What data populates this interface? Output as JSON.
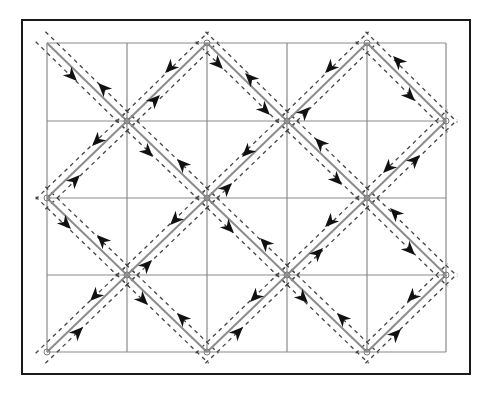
{
  "canvas": {
    "width": 487,
    "height": 401,
    "background": "#ffffff"
  },
  "frame": {
    "x": 22,
    "y": 20,
    "width": 448,
    "height": 354,
    "stroke": "#1a1a1a",
    "stroke_width": 2
  },
  "grid": {
    "cols_x": [
      47,
      127,
      207,
      287,
      367,
      446
    ],
    "rows_y": [
      43,
      121,
      198,
      275,
      352
    ],
    "stroke": "#8a8a8a",
    "stroke_width": 1.2
  },
  "colors": {
    "edge": "#8c8c8c",
    "dashed": "#444444",
    "arrow": "#111111"
  },
  "dashed_offset": 7,
  "edges": [
    {
      "from": [
        47,
        43
      ],
      "to": [
        127,
        121
      ]
    },
    {
      "from": [
        127,
        121
      ],
      "to": [
        207,
        43
      ]
    },
    {
      "from": [
        207,
        43
      ],
      "to": [
        287,
        121
      ]
    },
    {
      "from": [
        287,
        121
      ],
      "to": [
        367,
        43
      ]
    },
    {
      "from": [
        367,
        43
      ],
      "to": [
        446,
        121
      ]
    },
    {
      "from": [
        47,
        198
      ],
      "to": [
        127,
        121
      ]
    },
    {
      "from": [
        127,
        121
      ],
      "to": [
        207,
        198
      ]
    },
    {
      "from": [
        207,
        198
      ],
      "to": [
        287,
        121
      ]
    },
    {
      "from": [
        287,
        121
      ],
      "to": [
        367,
        198
      ]
    },
    {
      "from": [
        367,
        198
      ],
      "to": [
        446,
        121
      ]
    },
    {
      "from": [
        47,
        198
      ],
      "to": [
        127,
        275
      ]
    },
    {
      "from": [
        127,
        275
      ],
      "to": [
        207,
        198
      ]
    },
    {
      "from": [
        207,
        198
      ],
      "to": [
        287,
        275
      ]
    },
    {
      "from": [
        287,
        275
      ],
      "to": [
        367,
        198
      ]
    },
    {
      "from": [
        367,
        198
      ],
      "to": [
        446,
        275
      ]
    },
    {
      "from": [
        47,
        352
      ],
      "to": [
        127,
        275
      ]
    },
    {
      "from": [
        127,
        275
      ],
      "to": [
        207,
        352
      ]
    },
    {
      "from": [
        207,
        352
      ],
      "to": [
        287,
        275
      ]
    },
    {
      "from": [
        287,
        275
      ],
      "to": [
        367,
        352
      ]
    },
    {
      "from": [
        367,
        352
      ],
      "to": [
        446,
        275
      ]
    }
  ],
  "arrows": [
    {
      "x": 72,
      "y": 76,
      "dir": "down-right"
    },
    {
      "x": 103,
      "y": 88,
      "dir": "up-left"
    },
    {
      "x": 170,
      "y": 68,
      "dir": "down-left"
    },
    {
      "x": 155,
      "y": 100,
      "dir": "up-right"
    },
    {
      "x": 218,
      "y": 64,
      "dir": "down-right"
    },
    {
      "x": 250,
      "y": 78,
      "dir": "up-left"
    },
    {
      "x": 265,
      "y": 110,
      "dir": "down-right"
    },
    {
      "x": 330,
      "y": 68,
      "dir": "down-left"
    },
    {
      "x": 305,
      "y": 112,
      "dir": "up-right"
    },
    {
      "x": 398,
      "y": 61,
      "dir": "up-left"
    },
    {
      "x": 410,
      "y": 96,
      "dir": "down-right"
    },
    {
      "x": 97,
      "y": 141,
      "dir": "down-left"
    },
    {
      "x": 75,
      "y": 180,
      "dir": "up-right"
    },
    {
      "x": 148,
      "y": 152,
      "dir": "down-right"
    },
    {
      "x": 182,
      "y": 164,
      "dir": "up-left"
    },
    {
      "x": 247,
      "y": 152,
      "dir": "down-left"
    },
    {
      "x": 227,
      "y": 188,
      "dir": "up-right"
    },
    {
      "x": 320,
      "y": 143,
      "dir": "up-left"
    },
    {
      "x": 337,
      "y": 180,
      "dir": "down-right"
    },
    {
      "x": 388,
      "y": 168,
      "dir": "down-left"
    },
    {
      "x": 415,
      "y": 160,
      "dir": "up-right"
    },
    {
      "x": 66,
      "y": 224,
      "dir": "down-right"
    },
    {
      "x": 102,
      "y": 240,
      "dir": "up-left"
    },
    {
      "x": 175,
      "y": 220,
      "dir": "down-left"
    },
    {
      "x": 147,
      "y": 265,
      "dir": "up-right"
    },
    {
      "x": 229,
      "y": 228,
      "dir": "down-right"
    },
    {
      "x": 265,
      "y": 243,
      "dir": "up-left"
    },
    {
      "x": 330,
      "y": 222,
      "dir": "down-left"
    },
    {
      "x": 318,
      "y": 253,
      "dir": "up-right"
    },
    {
      "x": 395,
      "y": 213,
      "dir": "up-left"
    },
    {
      "x": 410,
      "y": 250,
      "dir": "down-right"
    },
    {
      "x": 95,
      "y": 296,
      "dir": "down-left"
    },
    {
      "x": 78,
      "y": 332,
      "dir": "up-right"
    },
    {
      "x": 143,
      "y": 300,
      "dir": "down-right"
    },
    {
      "x": 182,
      "y": 318,
      "dir": "up-left"
    },
    {
      "x": 255,
      "y": 297,
      "dir": "down-left"
    },
    {
      "x": 238,
      "y": 332,
      "dir": "up-right"
    },
    {
      "x": 303,
      "y": 298,
      "dir": "down-right"
    },
    {
      "x": 342,
      "y": 318,
      "dir": "up-left"
    },
    {
      "x": 412,
      "y": 297,
      "dir": "down-left"
    },
    {
      "x": 396,
      "y": 334,
      "dir": "up-right"
    }
  ],
  "vertices": [
    [
      127,
      121
    ],
    [
      287,
      121
    ],
    [
      207,
      198
    ],
    [
      367,
      198
    ],
    [
      127,
      275
    ],
    [
      287,
      275
    ],
    [
      207,
      43
    ],
    [
      367,
      43
    ],
    [
      47,
      198
    ],
    [
      446,
      121
    ],
    [
      446,
      275
    ],
    [
      47,
      352
    ],
    [
      207,
      352
    ],
    [
      367,
      352
    ]
  ]
}
